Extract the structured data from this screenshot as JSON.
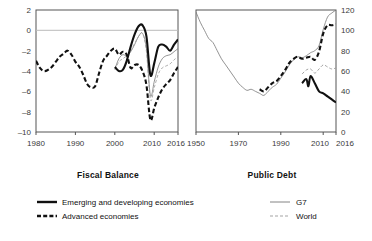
{
  "figure": {
    "background": "#ffffff",
    "width": 372,
    "height": 241
  },
  "panels": [
    {
      "id": "fiscal-balance",
      "title": "Fiscal Balance"
    },
    {
      "id": "public-debt",
      "title": "Public Debt"
    }
  ],
  "legend": {
    "left_column": [
      {
        "label": "Emerging and developing economies",
        "style": "solid-thick",
        "color": "#111111"
      },
      {
        "label": "Advanced economies",
        "style": "dashed-thick",
        "color": "#111111"
      }
    ],
    "right_column": [
      {
        "label": "G7",
        "style": "solid-thin",
        "color": "#777777"
      },
      {
        "label": "World",
        "style": "dashed-thin",
        "color": "#999999"
      }
    ]
  },
  "colors": {
    "emerging": "#111111",
    "advanced": "#111111",
    "g7": "#777777",
    "world": "#999999",
    "axis": "#555555",
    "zero_line": "#bbbbbb"
  },
  "chart_data": [
    {
      "type": "line",
      "id": "fiscal-balance",
      "title": "Fiscal Balance",
      "xlabel": "",
      "ylabel": "",
      "xlim": [
        1980,
        2016
      ],
      "ylim": [
        -10,
        2
      ],
      "xticks": [
        1980,
        1990,
        2000,
        2010,
        2016
      ],
      "xticklabels": [
        "1980",
        "1990",
        "2000",
        "2010",
        "2016"
      ],
      "yticks": [
        2,
        0,
        -2,
        -4,
        -6,
        -8,
        -10
      ],
      "yticklabels": [
        "2",
        "0",
        "–2",
        "–4",
        "–6",
        "–8",
        "–10"
      ],
      "grid": false,
      "zero_line": true,
      "legend_position": "below-figure",
      "series": [
        {
          "name": "Emerging and developing economies",
          "style": "solid-thick",
          "color": "#111111",
          "x": [
            2000,
            2001,
            2002,
            2003,
            2004,
            2005,
            2006,
            2007,
            2008,
            2009,
            2010,
            2011,
            2012,
            2013,
            2014,
            2015,
            2016
          ],
          "values": [
            -3.6,
            -4.0,
            -3.9,
            -3.0,
            -1.6,
            -0.4,
            0.4,
            0.5,
            -0.6,
            -4.4,
            -3.2,
            -1.6,
            -1.4,
            -1.6,
            -2.0,
            -1.4,
            -0.9
          ]
        },
        {
          "name": "Advanced economies",
          "style": "dashed-thick",
          "color": "#111111",
          "x": [
            1980,
            1981,
            1982,
            1983,
            1984,
            1985,
            1986,
            1987,
            1988,
            1989,
            1990,
            1991,
            1992,
            1993,
            1994,
            1995,
            1996,
            1997,
            1998,
            1999,
            2000,
            2001,
            2002,
            2003,
            2004,
            2005,
            2006,
            2007,
            2008,
            2009,
            2010,
            2011,
            2012,
            2013,
            2014,
            2015,
            2016
          ],
          "values": [
            -3.0,
            -3.7,
            -4.0,
            -3.9,
            -3.6,
            -3.1,
            -2.6,
            -2.3,
            -2.0,
            -2.4,
            -3.1,
            -3.6,
            -4.4,
            -5.3,
            -5.6,
            -5.5,
            -4.2,
            -3.0,
            -2.5,
            -2.0,
            -1.8,
            -2.4,
            -2.1,
            -2.4,
            -3.7,
            -3.4,
            -3.4,
            -4.0,
            -5.4,
            -8.8,
            -7.6,
            -6.6,
            -5.8,
            -5.3,
            -4.9,
            -4.2,
            -3.6
          ]
        },
        {
          "name": "G7",
          "style": "solid-thin",
          "color": "#777777",
          "x": [
            2000,
            2001,
            2002,
            2003,
            2004,
            2005,
            2006,
            2007,
            2008,
            2009,
            2010,
            2011,
            2012,
            2013,
            2014,
            2015,
            2016
          ],
          "values": [
            -3.8,
            -2.8,
            -2.4,
            -2.5,
            -2.1,
            -1.4,
            -0.6,
            -0.3,
            -1.8,
            -6.4,
            -5.0,
            -3.6,
            -2.8,
            -2.5,
            -2.4,
            -2.1,
            -1.8
          ]
        },
        {
          "name": "World",
          "style": "dashed-thin",
          "color": "#999999",
          "x": [
            2000,
            2001,
            2002,
            2003,
            2004,
            2005,
            2006,
            2007,
            2008,
            2009,
            2010,
            2011,
            2012,
            2013,
            2014,
            2015,
            2016
          ],
          "values": [
            -3.9,
            -3.1,
            -2.8,
            -2.5,
            -2.0,
            -1.3,
            -0.6,
            -0.3,
            -2.1,
            -6.8,
            -5.6,
            -4.3,
            -3.7,
            -3.5,
            -3.3,
            -2.9,
            -2.6
          ]
        }
      ]
    },
    {
      "type": "line",
      "id": "public-debt",
      "title": "Public Debt",
      "xlabel": "",
      "ylabel": "",
      "xlim": [
        1950,
        2016
      ],
      "ylim": [
        0,
        120
      ],
      "xticks": [
        1950,
        1970,
        1990,
        2010,
        2016
      ],
      "xticklabels": [
        "1950",
        "1970",
        "1990",
        "2010",
        "2016"
      ],
      "yticks": [
        0,
        20,
        40,
        60,
        80,
        100,
        120
      ],
      "yticklabels": [
        "0",
        "20",
        "40",
        "60",
        "80",
        "100",
        "120"
      ],
      "grid": false,
      "zero_line": false,
      "legend_position": "below-figure",
      "series": [
        {
          "name": "G7",
          "style": "solid-thin",
          "color": "#777777",
          "x": [
            1950,
            1952,
            1954,
            1956,
            1958,
            1960,
            1962,
            1964,
            1966,
            1968,
            1970,
            1972,
            1974,
            1976,
            1978,
            1980,
            1982,
            1984,
            1986,
            1988,
            1990,
            1992,
            1994,
            1996,
            1998,
            2000,
            2002,
            2004,
            2006,
            2008,
            2010,
            2012,
            2014,
            2016
          ],
          "values": [
            118,
            108,
            100,
            92,
            88,
            80,
            72,
            66,
            60,
            54,
            48,
            44,
            41,
            42,
            40,
            38,
            36,
            40,
            44,
            47,
            53,
            59,
            66,
            71,
            74,
            73,
            75,
            78,
            80,
            85,
            101,
            113,
            117,
            120
          ]
        },
        {
          "name": "Advanced economies",
          "style": "dashed-thick",
          "color": "#111111",
          "x": [
            1980,
            1982,
            1984,
            1986,
            1988,
            1990,
            1992,
            1994,
            1996,
            1998,
            2000,
            2002,
            2004,
            2006,
            2008,
            2010,
            2012,
            2014,
            2016
          ],
          "values": [
            42,
            40,
            44,
            48,
            50,
            55,
            61,
            68,
            72,
            74,
            72,
            73,
            74,
            71,
            79,
            97,
            105,
            105,
            106
          ]
        },
        {
          "name": "World",
          "style": "dashed-thin",
          "color": "#999999",
          "x": [
            2000,
            2002,
            2004,
            2006,
            2008,
            2010,
            2012,
            2014,
            2016
          ],
          "values": [
            57,
            61,
            62,
            58,
            62,
            66,
            64,
            62,
            63
          ]
        },
        {
          "name": "Emerging and developing economies",
          "style": "solid-thick",
          "color": "#111111",
          "x": [
            2000,
            2002,
            2003,
            2004,
            2006,
            2008,
            2010,
            2012,
            2014,
            2016
          ],
          "values": [
            48,
            52,
            45,
            55,
            48,
            40,
            38,
            35,
            32,
            29
          ]
        }
      ]
    }
  ]
}
